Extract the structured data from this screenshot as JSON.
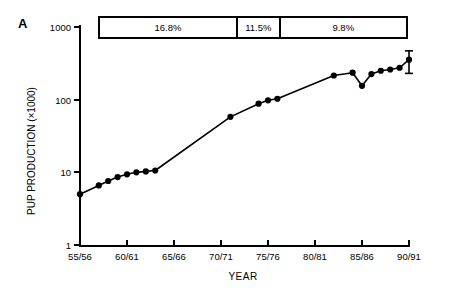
{
  "panel": {
    "letter": "A"
  },
  "rate_bar": {
    "segments": [
      {
        "label": "16.8%",
        "start_year": 1955,
        "end_year": 1971
      },
      {
        "label": "11.5%",
        "start_year": 1971,
        "end_year": 1976
      },
      {
        "label": "9.8%",
        "start_year": 1976,
        "end_year": 1991
      }
    ]
  },
  "axis": {
    "y_label": "PUP PRODUCTION (×1000)",
    "x_label": "YEAR",
    "y_ticks": [
      "1",
      "10",
      "100",
      "1000"
    ],
    "x_ticks": [
      "55/56",
      "60/61",
      "65/66",
      "70/71",
      "75/76",
      "80/81",
      "85/86",
      "90/91"
    ]
  },
  "chart_data": {
    "type": "line",
    "title": "",
    "xlabel": "YEAR",
    "ylabel": "PUP PRODUCTION (×1000)",
    "yscale": "log",
    "ylim": [
      1,
      1000
    ],
    "xlim": [
      1955,
      1991
    ],
    "grid": false,
    "legend": null,
    "marker": "filled-circle",
    "x_tick_labels": [
      "55/56",
      "60/61",
      "65/66",
      "70/71",
      "75/76",
      "80/81",
      "85/86",
      "90/91"
    ],
    "x_tick_values": [
      1955,
      1960,
      1965,
      1970,
      1975,
      1980,
      1985,
      1990
    ],
    "y_tick_values": [
      1,
      10,
      100,
      1000
    ],
    "series": [
      {
        "name": "Pup production",
        "x": [
          1955,
          1957,
          1958,
          1959,
          1960,
          1961,
          1962,
          1963,
          1971,
          1974,
          1975,
          1976,
          1982,
          1984,
          1985,
          1986,
          1987,
          1988,
          1989,
          1990
        ],
        "values": [
          5.0,
          6.6,
          7.6,
          8.6,
          9.4,
          10.0,
          10.3,
          10.6,
          58,
          88,
          98,
          103,
          215,
          235,
          155,
          225,
          250,
          260,
          275,
          355
        ],
        "error_bars": [
          {
            "x": 1990,
            "value": 355,
            "lower": 230,
            "upper": 470
          }
        ]
      }
    ],
    "annotations": [
      {
        "text": "16.8%",
        "type": "growth-rate-segment",
        "x_start": 1955,
        "x_end": 1971
      },
      {
        "text": "11.5%",
        "type": "growth-rate-segment",
        "x_start": 1971,
        "x_end": 1976
      },
      {
        "text": "9.8%",
        "type": "growth-rate-segment",
        "x_start": 1976,
        "x_end": 1991
      },
      {
        "text": "A",
        "type": "panel-label"
      }
    ]
  }
}
